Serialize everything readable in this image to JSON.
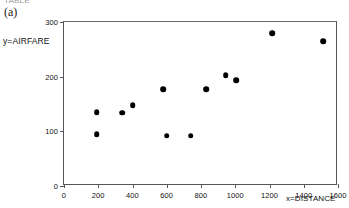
{
  "figure": {
    "clipped_top_text": "TABLE",
    "panel_label": "(a)"
  },
  "chart_data": {
    "type": "scatter",
    "title": "",
    "xlabel": "x=DISTANCE",
    "ylabel": "y=AIRFARE",
    "xlim": [
      0,
      1600
    ],
    "ylim": [
      0,
      300
    ],
    "xticks": [
      0,
      200,
      400,
      600,
      800,
      1000,
      1200,
      1400,
      1600
    ],
    "yticks": [
      0,
      100,
      200,
      300
    ],
    "xtick_labels": [
      "0",
      "200",
      "400",
      "600",
      "800",
      "1000",
      "1200",
      "1400",
      "1600"
    ],
    "ytick_labels": [
      "0",
      "100",
      "200",
      "300"
    ],
    "grid": false,
    "legend": null,
    "marker": "filled-circle",
    "marker_color": "#000000",
    "points": [
      {
        "x": 190,
        "y": 135
      },
      {
        "x": 190,
        "y": 95
      },
      {
        "x": 340,
        "y": 134
      },
      {
        "x": 400,
        "y": 148
      },
      {
        "x": 578,
        "y": 177
      },
      {
        "x": 600,
        "y": 92
      },
      {
        "x": 740,
        "y": 92
      },
      {
        "x": 830,
        "y": 177
      },
      {
        "x": 945,
        "y": 203
      },
      {
        "x": 1005,
        "y": 194
      },
      {
        "x": 1215,
        "y": 280
      },
      {
        "x": 1512,
        "y": 265
      }
    ]
  }
}
